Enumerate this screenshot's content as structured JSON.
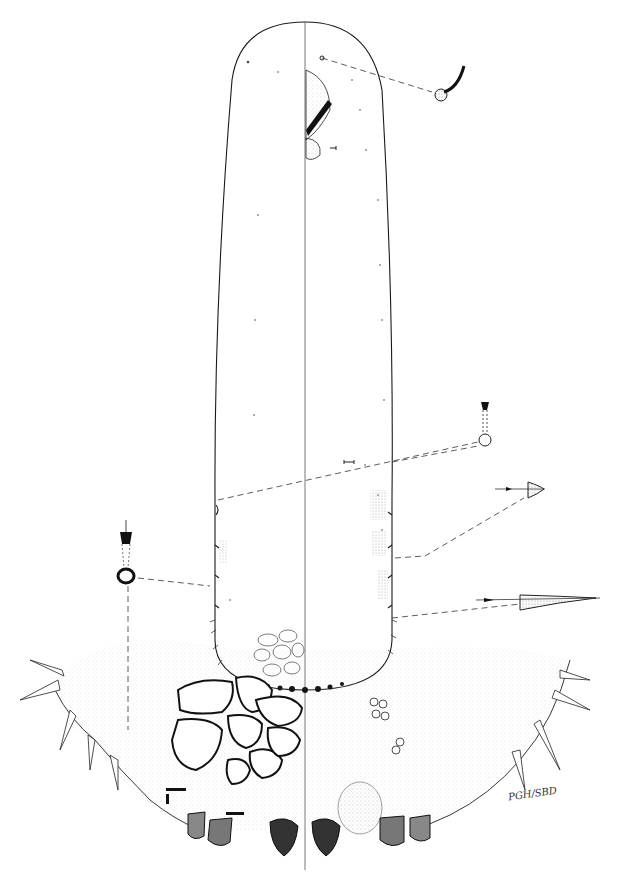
{
  "figure": {
    "signature": "PGH/SBD",
    "colors": {
      "ink": "#1a1a1a",
      "background": "#ffffff",
      "stipple": "#888888"
    }
  },
  "insets": [
    {
      "name": "curved-seta-detail",
      "position": "top-right"
    },
    {
      "name": "tubular-duct-detail-right",
      "position": "middle-right"
    },
    {
      "name": "spine-detail-short",
      "position": "right"
    },
    {
      "name": "spine-detail-long",
      "position": "lower-right"
    },
    {
      "name": "tubular-duct-detail-left",
      "position": "middle-left"
    }
  ]
}
